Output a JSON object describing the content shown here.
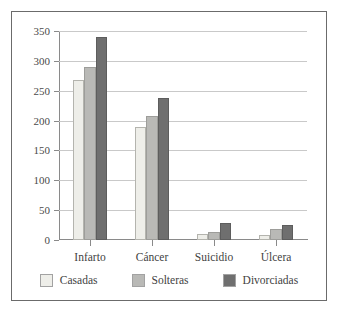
{
  "chart_data": {
    "type": "bar",
    "title": "",
    "subtitle": "",
    "xlabel": "",
    "ylabel": "",
    "categories": [
      "Infarto",
      "Cáncer",
      "Suicidio",
      "Úlcera"
    ],
    "series": [
      {
        "name": "Casadas",
        "values": [
          268,
          189,
          10,
          8
        ],
        "color": "#eeeee9"
      },
      {
        "name": "Solteras",
        "values": [
          290,
          208,
          14,
          19
        ],
        "color": "#b9b9b6"
      },
      {
        "name": "Divorciadas",
        "values": [
          340,
          238,
          28,
          25
        ],
        "color": "#6f6f6f"
      }
    ],
    "ylim": [
      0,
      350
    ],
    "yticks": [
      0,
      50,
      100,
      150,
      200,
      250,
      300,
      350
    ],
    "ytick_labels": [
      "0",
      "50",
      "100",
      "150",
      "200",
      "250",
      "300",
      "350"
    ],
    "grid": true,
    "grid_axis": "y",
    "legend": true,
    "legend_position": "bottom",
    "frame": true
  },
  "colors": {
    "frame": "#6b6b6b",
    "axis": "#8a8a8a",
    "gridline": "#c9c9c9",
    "text": "#3f3f3f",
    "background": "#ffffff"
  }
}
